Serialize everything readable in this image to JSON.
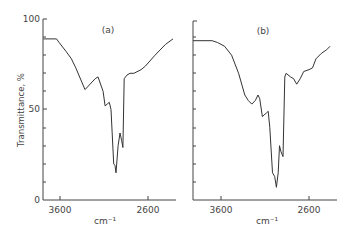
{
  "chart_data": [
    {
      "type": "line",
      "title": "(a)",
      "xlabel": "cm⁻¹",
      "ylabel": "Transmittance, %",
      "xlim": [
        3800,
        2300
      ],
      "ylim": [
        0,
        100
      ],
      "x_ticks": [
        "3600",
        "2600"
      ],
      "y_ticks": [
        "0",
        "50",
        "100"
      ],
      "grid": false,
      "series": [
        {
          "name": "spectrum a",
          "x": [
            3790,
            3640,
            3610,
            3530,
            3470,
            3420,
            3316,
            3200,
            3168,
            3110,
            3088,
            3064,
            3040,
            3020,
            2990,
            2975,
            2964,
            2940,
            2918,
            2900,
            2885,
            2870,
            2840,
            2805,
            2760,
            2680,
            2630,
            2520,
            2400,
            2316
          ],
          "values": [
            89,
            89,
            87,
            82,
            78,
            73,
            61,
            67,
            68,
            60,
            52,
            53,
            54,
            50,
            20,
            19,
            15,
            30,
            37,
            33,
            29,
            67,
            69,
            70,
            70,
            72,
            74,
            80,
            86,
            89
          ]
        }
      ]
    },
    {
      "type": "line",
      "title": "(b)",
      "xlabel": "cm⁻¹",
      "ylabel": "",
      "xlim": [
        3800,
        2300
      ],
      "ylim": [
        0,
        100
      ],
      "x_ticks": [
        "3600",
        "2600"
      ],
      "y_ticks": [],
      "grid": false,
      "series": [
        {
          "name": "spectrum b",
          "x": [
            3920,
            3700,
            3640,
            3560,
            3480,
            3400,
            3330,
            3290,
            3250,
            3210,
            3180,
            3160,
            3130,
            3110,
            3085,
            3064,
            3045,
            3015,
            2990,
            2970,
            2950,
            2935,
            2920,
            2905,
            2895,
            2875,
            2860,
            2810,
            2775,
            2740,
            2700,
            2660,
            2600,
            2560,
            2520,
            2460,
            2400,
            2360
          ],
          "values": [
            88,
            88,
            87,
            85,
            80,
            70,
            58,
            55,
            53,
            55,
            58,
            56,
            46,
            47,
            48,
            49,
            40,
            15,
            13,
            7,
            15,
            30,
            27,
            25,
            24,
            68,
            70,
            68,
            67,
            64,
            67,
            71,
            72,
            73,
            78,
            81,
            83,
            85
          ]
        }
      ]
    }
  ]
}
